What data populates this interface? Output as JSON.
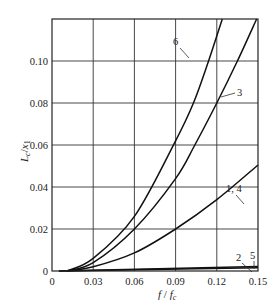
{
  "chart_data": {
    "type": "line",
    "title": "",
    "xlabel": "f / f_c",
    "ylabel": "L_c / x_1",
    "xlim": [
      0,
      0.15
    ],
    "ylim": [
      0,
      0.12
    ],
    "grid": true,
    "legend": "inline curve labels",
    "x_ticks": [
      "0",
      "0.03",
      "0.06",
      "0.09",
      "0.12",
      "0.15"
    ],
    "y_ticks": [
      "0",
      "0.02",
      "0.04",
      "0.06",
      "0.08",
      "0.10"
    ],
    "series": [
      {
        "name": "6",
        "x": [
          0.011,
          0.03,
          0.06,
          0.09,
          0.103,
          0.114,
          0.124
        ],
        "values": [
          0.0,
          0.006,
          0.026,
          0.062,
          0.08,
          0.1,
          0.12
        ]
      },
      {
        "name": "3",
        "x": [
          0.011,
          0.03,
          0.06,
          0.09,
          0.104,
          0.12,
          0.135,
          0.149
        ],
        "values": [
          0.0,
          0.004,
          0.02,
          0.044,
          0.06,
          0.08,
          0.1,
          0.12
        ]
      },
      {
        "name": "1, 4",
        "x": [
          0.011,
          0.03,
          0.06,
          0.09,
          0.12,
          0.15
        ],
        "values": [
          0.0,
          0.002,
          0.0086,
          0.02,
          0.034,
          0.0505
        ]
      },
      {
        "name": "2",
        "x": [
          0.005,
          0.15
        ],
        "values": [
          0.0,
          0.0015
        ]
      },
      {
        "name": "5",
        "x": [
          0.005,
          0.15
        ],
        "values": [
          0.0,
          0.0022
        ]
      }
    ],
    "annotations": [
      {
        "text": "6",
        "target_series": "6"
      },
      {
        "text": "3",
        "target_series": "3"
      },
      {
        "text": "1, 4",
        "target_series": "1, 4"
      },
      {
        "text": "2",
        "target_series": "2"
      },
      {
        "text": "5",
        "target_series": "5"
      }
    ]
  },
  "labels": {
    "x_axis_main": "f",
    "x_axis_slash": " / ",
    "x_axis_sub_base": "f",
    "x_axis_sub": "c",
    "y_axis_main": "L",
    "y_axis_sub1": "c",
    "y_axis_slash": "/",
    "y_axis_den": "x",
    "y_axis_sub2": "1"
  }
}
